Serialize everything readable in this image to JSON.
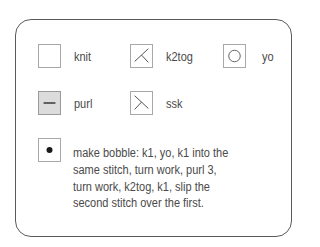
{
  "legend": {
    "items": [
      {
        "symbol": "blank-square",
        "label": "knit"
      },
      {
        "symbol": "right-slant-decrease",
        "label": "k2tog"
      },
      {
        "symbol": "circle",
        "label": "yo"
      },
      {
        "symbol": "horizontal-dash-shaded",
        "label": "purl"
      },
      {
        "symbol": "left-slant-decrease",
        "label": "ssk"
      },
      {
        "symbol": "filled-dot",
        "label": "make bobble: k1, yo, k1 into the same stitch, turn work, purl 3, turn work, k2tog, k1, slip the second stitch over the first."
      }
    ],
    "bobble_lines": [
      "make bobble: k1, yo, k1 into the",
      "same stitch, turn work, purl 3,",
      "turn work, k2tog, k1, slip the",
      "second stitch over the first."
    ]
  },
  "colors": {
    "border": "#5a5a5a",
    "symbol_border": "#a8a8a8",
    "purl_fill": "#dcdcdc",
    "text": "#4a4a4a",
    "ink": "#333333"
  }
}
